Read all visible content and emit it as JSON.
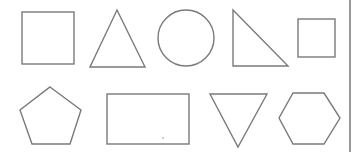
{
  "diagram": {
    "title": "",
    "background": "#ffffff",
    "stroke_color": "#7a7a7a",
    "divider": {
      "x": 350,
      "y1": 0,
      "y2": 152
    },
    "rows": [
      {
        "row": 1,
        "shapes": [
          {
            "name": "square",
            "type": "rect",
            "x": 22,
            "y": 12,
            "w": 52,
            "h": 52
          },
          {
            "name": "triangle",
            "type": "polygon",
            "points": "117,10 145,67 90,67"
          },
          {
            "name": "circle",
            "type": "circle",
            "cx": 186,
            "cy": 38,
            "r": 28
          },
          {
            "name": "right-triangle",
            "type": "polygon",
            "points": "233,10 288,66 233,66"
          },
          {
            "name": "small-square",
            "type": "rect",
            "x": 298,
            "y": 19,
            "w": 37,
            "h": 38
          }
        ]
      },
      {
        "row": 2,
        "shapes": [
          {
            "name": "pentagon",
            "type": "polygon",
            "points": "50,87 81,110 70,144 32,144 20,110"
          },
          {
            "name": "rectangle",
            "type": "rect",
            "x": 107,
            "y": 94,
            "w": 82,
            "h": 50
          },
          {
            "name": "inverted-triangle",
            "type": "polygon",
            "points": "210,94 267,94 238,147"
          },
          {
            "name": "hexagon",
            "type": "polygon",
            "points": "293,93 324,93 340,118 324,144 293,144 279,118"
          }
        ]
      }
    ],
    "artifacts": [
      {
        "name": "stray-dot",
        "cx": 163,
        "cy": 138,
        "r": 0.8
      }
    ]
  }
}
